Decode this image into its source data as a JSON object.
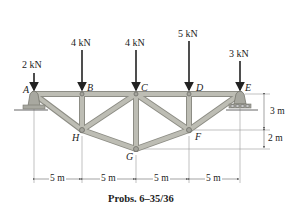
{
  "diagram": {
    "caption": "Probs. 6–35/36",
    "loads": [
      {
        "node": "A",
        "label": "2 kN"
      },
      {
        "node": "B",
        "label": "4 kN"
      },
      {
        "node": "C",
        "label": "4 kN"
      },
      {
        "node": "D",
        "label": "5 kN"
      },
      {
        "node": "E",
        "label": "3 kN"
      }
    ],
    "nodes": [
      "A",
      "B",
      "C",
      "D",
      "E",
      "F",
      "G",
      "H"
    ],
    "dimensions": {
      "horizontal": [
        "5 m",
        "5 m",
        "5 m",
        "5 m"
      ],
      "vertical": [
        "3 m",
        "2 m"
      ]
    },
    "colors": {
      "member_fill": "#b9b9b0",
      "member_edge": "#8d8d85",
      "support_fill": "#a8a8a0",
      "arrow": "#222222",
      "dim_line": "#666666"
    }
  }
}
